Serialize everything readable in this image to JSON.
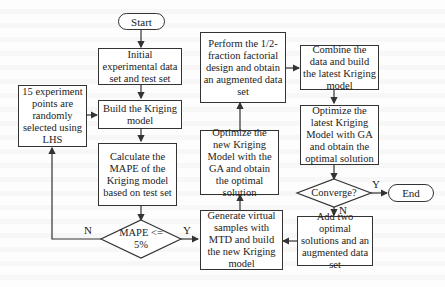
{
  "flowchart": {
    "start": "Start",
    "end": "End",
    "initial": "Initial experimental data set and test set",
    "lhs": "15 experiment points are randomly selected using LHS",
    "build": "Build the Kriging model",
    "calculate": "Calculate the MAPE of the Kriging model based on test set",
    "mape_decision": "MAPE <= 5%",
    "mape_no": "N",
    "mape_yes": "Y",
    "generate": "Generate virtual samples with MTD and build the new Kriging model",
    "optimize_new": "Optimize the new Kriging Model with the GA and obtain the optimal solution",
    "perform": "Perform the 1/2-fraction factorial design and obtain an augmented data set",
    "combine": "Combine the data and build the latest Kriging model",
    "optimize_latest": "Optimize the latest Kriging Model with GA and obtain the optimal solution",
    "converge_decision": "Converge?",
    "converge_yes": "Y",
    "converge_no": "N",
    "add": "Add two optimal solutions and an augmented data set"
  },
  "colors": {
    "line": "#333333",
    "background": "#fdfdfd"
  }
}
